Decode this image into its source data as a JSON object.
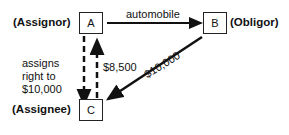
{
  "nodes": {
    "a": {
      "letter": "A",
      "role": "(Assignor)"
    },
    "b": {
      "letter": "B",
      "role": "(Obligor)"
    },
    "c": {
      "letter": "C",
      "role": "(Assignee)"
    }
  },
  "edges": {
    "a_to_b": {
      "label": "automobile"
    },
    "a_to_c": {
      "label_line1": "assigns",
      "label_line2": "right to",
      "label_line3": "$10,000"
    },
    "c_to_a": {
      "label": "$8,500"
    },
    "b_to_c": {
      "label": "$10,000"
    }
  },
  "colors": {
    "line": "#111111",
    "background": "#ffffff"
  }
}
